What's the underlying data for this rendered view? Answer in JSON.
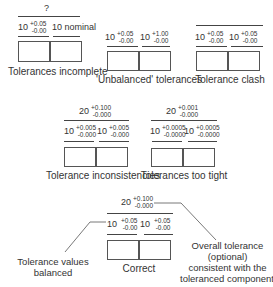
{
  "panels": {
    "incomplete": {
      "overall": "?",
      "dims": [
        {
          "nominal": "10",
          "upper": "+0.05",
          "lower": "-0.00"
        },
        {
          "nominal": "10 nominal"
        }
      ],
      "caption": "Tolerances incomplete"
    },
    "unbalanced": {
      "dims": [
        {
          "nominal": "10",
          "upper": "+0.05",
          "lower": "-0.00"
        },
        {
          "nominal": "10",
          "upper": "+1.00",
          "lower": "-0.00"
        }
      ],
      "caption": "'Unbalanced' tolerances"
    },
    "clash": {
      "dims": [
        {
          "nominal": "10",
          "upper": "+0.05",
          "lower": "-0.00"
        },
        {
          "nominal": "10",
          "upper": "+0.05",
          "lower": "-0.00"
        }
      ],
      "caption": "Tolerance clash"
    },
    "inconsistencies": {
      "overall": {
        "nominal": "20",
        "upper": "+0.100",
        "lower": "-0.000"
      },
      "dims": [
        {
          "nominal": "10",
          "upper": "+0.005",
          "lower": "-0.000"
        },
        {
          "nominal": "10",
          "upper": "+0.005",
          "lower": "-0.000"
        }
      ],
      "caption": "Tolerance inconsistencies"
    },
    "too_tight": {
      "overall": {
        "nominal": "20",
        "upper": "+0.001",
        "lower": "-0.000"
      },
      "dims": [
        {
          "nominal": "10",
          "upper": "+0.0005",
          "lower": "-0.0000"
        },
        {
          "nominal": "10",
          "upper": "+0.0005",
          "lower": "-0.0000"
        }
      ],
      "caption": "Tolerances too tight"
    },
    "correct": {
      "overall": {
        "nominal": "20",
        "upper": "+0.100",
        "lower": "-0.000"
      },
      "dims": [
        {
          "nominal": "10",
          "upper": "+0.05",
          "lower": "-0.00"
        },
        {
          "nominal": "10",
          "upper": "+0.05",
          "lower": "-0.00"
        }
      ],
      "caption": "Correct",
      "note_left": [
        "Tolerance values",
        "balanced"
      ],
      "note_right": [
        "Overall tolerance",
        "(optional)",
        "consistent with the",
        "toleranced components"
      ]
    }
  }
}
